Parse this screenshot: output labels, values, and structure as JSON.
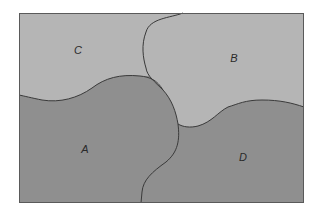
{
  "diagram": {
    "title": "",
    "type": "region-adjacency-map",
    "frame": {
      "x": 19,
      "y": 13,
      "width": 285,
      "height": 190,
      "border_color": "#5a5a5a"
    },
    "colors": {
      "light_region": "#b5b5b5",
      "dark_region": "#8f8f8f",
      "boundary": "#3a3a3a",
      "label": "#2a2a2a"
    },
    "regions": [
      {
        "id": "A",
        "label": "A",
        "shade": "dark",
        "label_pos": {
          "x": 85,
          "y": 149
        }
      },
      {
        "id": "B",
        "label": "B",
        "shade": "light",
        "label_pos": {
          "x": 234,
          "y": 58
        }
      },
      {
        "id": "C",
        "label": "C",
        "shade": "light",
        "label_pos": {
          "x": 78,
          "y": 50
        }
      },
      {
        "id": "D",
        "label": "D",
        "shade": "dark",
        "label_pos": {
          "x": 243,
          "y": 157
        }
      }
    ]
  }
}
